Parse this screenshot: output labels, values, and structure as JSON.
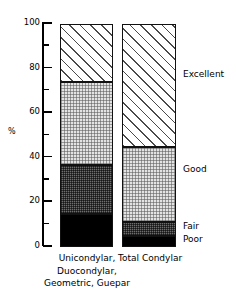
{
  "chart_data": {
    "type": "bar",
    "subtype": "stacked-bar-100",
    "title": "",
    "subtitle": "",
    "xlabel": "",
    "ylabel": "%",
    "ylim": [
      0,
      100
    ],
    "ytick_major": [
      0,
      20,
      40,
      60,
      80,
      100
    ],
    "ytick_minor": [
      10,
      30,
      50,
      70,
      90
    ],
    "ytick_labels": [
      "0",
      "20",
      "40",
      "60",
      "80",
      "100"
    ],
    "grid": false,
    "legend_position": "right-inline",
    "categories": [
      "Unicondylar, Duocondylar, Geometric, Guepar",
      "Total Condylar"
    ],
    "category_label_lines": [
      [
        "Unicondylar,",
        "Duocondylar,",
        "Geometric, Guepar"
      ],
      [
        "Total Condylar"
      ]
    ],
    "series": [
      {
        "name": "Poor",
        "values": [
          15,
          5
        ],
        "fill": "solid-black",
        "color": "#000000"
      },
      {
        "name": "Fair",
        "values": [
          22,
          6
        ],
        "fill": "dark-stipple",
        "color": "#6e6e6e"
      },
      {
        "name": "Good",
        "values": [
          37,
          34
        ],
        "fill": "light-stipple",
        "color": "#e3e3e3"
      },
      {
        "name": "Excellent",
        "values": [
          26,
          55
        ],
        "fill": "diagonal-hatch",
        "color": "#ffffff"
      }
    ],
    "cumulative_boundaries": {
      "Unicondylar, Duocondylar, Geometric, Guepar": [
        0,
        15,
        37,
        74,
        100
      ],
      "Total Condylar": [
        0,
        5,
        11,
        45,
        100
      ]
    },
    "annotations": [
      "Excellent",
      "Good",
      "Fair",
      "Poor"
    ]
  },
  "legend": {
    "excellent": "Excellent",
    "good": "Good",
    "fair": "Fair",
    "poor": "Poor"
  },
  "axis": {
    "y_title": "%",
    "labels": {
      "t100": "100",
      "t80": "80",
      "t60": "60",
      "t40": "40",
      "t20": "20",
      "t0": "0"
    }
  },
  "categories": {
    "bar0_line1": "Unicondylar,",
    "bar0_line2": "Duocondylar,",
    "bar0_line3": "Geometric, Guepar",
    "bar1_line1": "Total Condylar"
  }
}
